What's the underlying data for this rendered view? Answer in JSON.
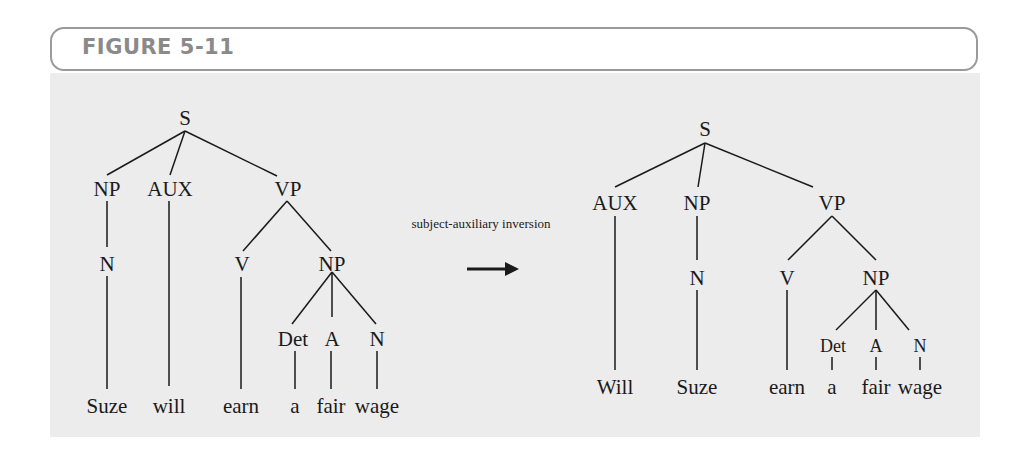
{
  "figure": {
    "title": "FIGURE 5-11",
    "colors": {
      "header_border": "#9a9a9a",
      "header_text": "#8a8a8a",
      "panel_bg": "#ececec",
      "ink": "#1a1a1a"
    }
  },
  "transformation": {
    "label": "subject-auxiliary inversion",
    "arrow": "right-arrow"
  },
  "left_tree": {
    "root": "S",
    "nodes": {
      "s": "S",
      "np": "NP",
      "aux": "AUX",
      "vp": "VP",
      "n": "N",
      "v": "V",
      "np2": "NP",
      "det": "Det",
      "a": "A",
      "n2": "N"
    },
    "words": [
      "Suze",
      "will",
      "earn",
      "a",
      "fair",
      "wage"
    ]
  },
  "right_tree": {
    "root": "S",
    "nodes": {
      "s": "S",
      "aux": "AUX",
      "np": "NP",
      "vp": "VP",
      "n": "N",
      "v": "V",
      "np2": "NP",
      "det": "Det",
      "a": "A",
      "n2": "N"
    },
    "words": [
      "Will",
      "Suze",
      "earn",
      "a",
      "fair",
      "wage"
    ]
  }
}
